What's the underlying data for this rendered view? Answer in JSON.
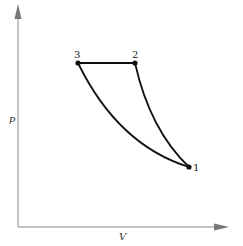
{
  "diagram": {
    "type": "p-V cycle diagram",
    "axes": {
      "x_label": "V",
      "y_label": "p"
    },
    "points": [
      {
        "id": "1",
        "label": "1",
        "x": 189,
        "y": 167
      },
      {
        "id": "2",
        "label": "2",
        "x": 135,
        "y": 63
      },
      {
        "id": "3",
        "label": "3",
        "x": 78,
        "y": 63
      }
    ],
    "paths": [
      {
        "from": "3",
        "to": "2",
        "shape": "horizontal line (constant pressure)"
      },
      {
        "from": "2",
        "to": "1",
        "shape": "steep curve"
      },
      {
        "from": "1",
        "to": "3",
        "shape": "shallower curve"
      }
    ],
    "colors": {
      "curve": "#111111",
      "axis": "#888888",
      "background": "#ffffff"
    }
  }
}
